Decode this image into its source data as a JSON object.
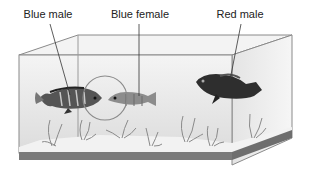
{
  "figure": {
    "labels": [
      {
        "text": "Blue male",
        "x": 48
      },
      {
        "text": "Blue female",
        "x": 140
      },
      {
        "text": "Red male",
        "x": 240
      }
    ]
  },
  "colors": {
    "tank_edge": "#8a8a8a",
    "tank_base": "#7a7a7a",
    "water": "#e6e6e6",
    "gravel": "#f2f2f2",
    "fish_dark": "#2e2e2e",
    "fish_mid": "#8c8c8c",
    "circle": "#8a8a8a"
  }
}
